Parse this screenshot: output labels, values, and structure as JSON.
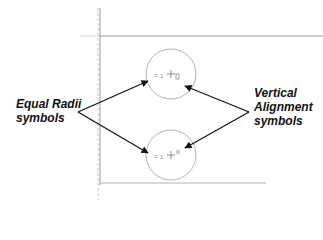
{
  "annotations": {
    "left_label_line1": "Equal Radii",
    "left_label_line2": "symbols",
    "right_label_line1": "Vertical",
    "right_label_line2": "Alignment",
    "right_label_line3": "symbols"
  },
  "sketch": {
    "circles": [
      {
        "name": "upper-circle",
        "cx": 171,
        "cy": 74,
        "r": 25
      },
      {
        "name": "lower-circle",
        "cx": 171,
        "cy": 155,
        "r": 25
      }
    ],
    "equal_symbol": "=",
    "equal_index": "1",
    "vertical_align_symbol": "⊥",
    "colors": {
      "line": "#9a9a9a",
      "circle": "#b5b5b5",
      "arrow": "#111111",
      "text": "#111111"
    }
  }
}
